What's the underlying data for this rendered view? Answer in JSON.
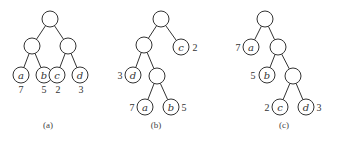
{
  "figure": {
    "node_radius": 8,
    "trees": [
      {
        "id": "a",
        "caption": "(a)",
        "caption_pos": [
          48,
          128
        ],
        "nodes": [
          {
            "id": "r",
            "x": 50,
            "y": 19,
            "label": ""
          },
          {
            "id": "l",
            "x": 32,
            "y": 46,
            "label": ""
          },
          {
            "id": "rr",
            "x": 68,
            "y": 46,
            "label": ""
          },
          {
            "id": "a",
            "x": 21,
            "y": 75,
            "label": "a",
            "weight": "7",
            "wx": 21,
            "wy": 93
          },
          {
            "id": "b",
            "x": 44,
            "y": 75,
            "label": "b",
            "weight": "5",
            "wx": 44,
            "wy": 93
          },
          {
            "id": "c",
            "x": 57,
            "y": 75,
            "label": "c",
            "weight": "2",
            "wx": 58,
            "wy": 93
          },
          {
            "id": "d",
            "x": 80,
            "y": 75,
            "label": "d",
            "weight": "3",
            "wx": 81,
            "wy": 93
          }
        ],
        "edges": [
          [
            "r",
            "l"
          ],
          [
            "r",
            "rr"
          ],
          [
            "l",
            "a"
          ],
          [
            "l",
            "b"
          ],
          [
            "rr",
            "c"
          ],
          [
            "rr",
            "d"
          ]
        ]
      },
      {
        "id": "b",
        "caption": "(b)",
        "caption_pos": [
          156,
          128
        ],
        "nodes": [
          {
            "id": "r",
            "x": 161,
            "y": 19,
            "label": ""
          },
          {
            "id": "l",
            "x": 144,
            "y": 45,
            "label": ""
          },
          {
            "id": "c",
            "x": 181,
            "y": 47,
            "label": "c",
            "weight": "2",
            "wx": 195,
            "wy": 51
          },
          {
            "id": "d",
            "x": 133,
            "y": 75,
            "label": "d",
            "weight": "3",
            "wx": 120,
            "wy": 79
          },
          {
            "id": "m",
            "x": 157,
            "y": 76,
            "label": ""
          },
          {
            "id": "a",
            "x": 145,
            "y": 107,
            "label": "a",
            "weight": "7",
            "wx": 132,
            "wy": 111
          },
          {
            "id": "b",
            "x": 171,
            "y": 107,
            "label": "b",
            "weight": "5",
            "wx": 184,
            "wy": 111
          }
        ],
        "edges": [
          [
            "r",
            "l"
          ],
          [
            "r",
            "c"
          ],
          [
            "l",
            "d"
          ],
          [
            "l",
            "m"
          ],
          [
            "m",
            "a"
          ],
          [
            "m",
            "b"
          ]
        ]
      },
      {
        "id": "c",
        "caption": "(c)",
        "caption_pos": [
          284,
          128
        ],
        "nodes": [
          {
            "id": "r",
            "x": 265,
            "y": 19,
            "label": ""
          },
          {
            "id": "a",
            "x": 251,
            "y": 47,
            "label": "a",
            "weight": "7",
            "wx": 238,
            "wy": 51
          },
          {
            "id": "m1",
            "x": 278,
            "y": 47,
            "label": ""
          },
          {
            "id": "b",
            "x": 267,
            "y": 75,
            "label": "b",
            "weight": "5",
            "wx": 253,
            "wy": 79
          },
          {
            "id": "m2",
            "x": 293,
            "y": 76,
            "label": ""
          },
          {
            "id": "c",
            "x": 280,
            "y": 107,
            "label": "c",
            "weight": "2",
            "wx": 267,
            "wy": 111
          },
          {
            "id": "d",
            "x": 306,
            "y": 107,
            "label": "d",
            "weight": "3",
            "wx": 319,
            "wy": 111
          }
        ],
        "edges": [
          [
            "r",
            "a"
          ],
          [
            "r",
            "m1"
          ],
          [
            "m1",
            "b"
          ],
          [
            "m1",
            "m2"
          ],
          [
            "m2",
            "c"
          ],
          [
            "m2",
            "d"
          ]
        ]
      }
    ]
  }
}
